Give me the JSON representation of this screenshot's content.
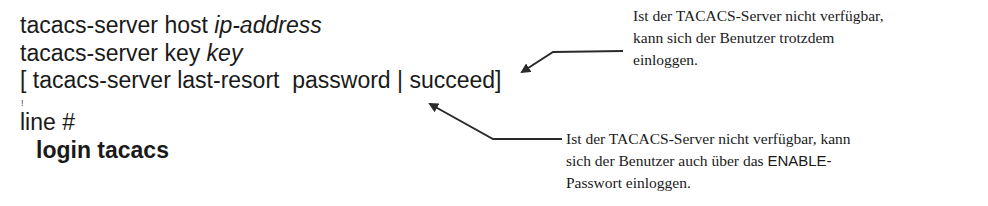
{
  "code_lines": {
    "line1": {
      "cmd": "tacacs-server host ",
      "arg": "ip-address"
    },
    "line2": {
      "cmd": "tacacs-server key ",
      "arg": "key"
    },
    "line3": {
      "text": "[ tacacs-server last-resort  password | succeed]"
    },
    "separator": "!",
    "line4": {
      "text": "line #"
    },
    "line5": {
      "text": "login tacacs"
    }
  },
  "annotations": [
    {
      "lines": [
        "Ist der TACACS-Server nicht verfügbar,",
        "kann sich der Benutzer trotzdem",
        "einloggen."
      ],
      "points_to": "succeed"
    },
    {
      "lines": [
        "Ist der TACACS-Server nicht verfügbar, kann",
        "sich der Benutzer auch über das ",
        "Passwort einloggen."
      ],
      "keyword": "ENABLE-",
      "points_to": "password"
    }
  ],
  "colors": {
    "text": "#1a1a1a",
    "arrow": "#2a2a2a",
    "background": "#ffffff"
  }
}
